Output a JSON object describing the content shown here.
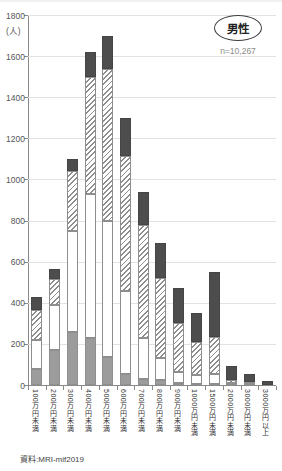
{
  "chart_data": {
    "type": "bar",
    "stacked": true,
    "unit_label": "(人)",
    "ylim": [
      0,
      1800
    ],
    "ytick_step": 200,
    "grid": true,
    "categories": [
      "100万円未満",
      "200万円未満",
      "300万円未満",
      "400万円未満",
      "500万円未満",
      "600万円未満",
      "700万円未満",
      "800万円未満",
      "900万円未満",
      "1000万円未満",
      "1500万円未満",
      "2000万円未満",
      "3000万円未満",
      "3000万円以上"
    ],
    "series": [
      {
        "name": "bottom-gray-solid",
        "pattern": "gray",
        "color": "#9c9c9c",
        "values": [
          80,
          170,
          260,
          230,
          135,
          55,
          30,
          25,
          10,
          5,
          5,
          0,
          0,
          0
        ]
      },
      {
        "name": "white-plain",
        "pattern": "white",
        "color": "#ffffff",
        "values": [
          140,
          220,
          490,
          700,
          665,
          400,
          200,
          105,
          55,
          45,
          50,
          10,
          5,
          0
        ]
      },
      {
        "name": "diagonal-hatch",
        "pattern": "hatch",
        "color": "#8e8e8e",
        "values": [
          145,
          125,
          290,
          570,
          735,
          660,
          550,
          390,
          235,
          160,
          180,
          15,
          10,
          0
        ]
      },
      {
        "name": "top-dark-gray",
        "pattern": "dark",
        "color": "#4d4d4d",
        "values": [
          65,
          50,
          60,
          120,
          165,
          185,
          160,
          170,
          170,
          140,
          315,
          70,
          40,
          20
        ]
      }
    ],
    "totals": [
      430,
      565,
      1100,
      1620,
      1700,
      1300,
      940,
      690,
      470,
      350,
      550,
      95,
      55,
      20
    ],
    "legend": {
      "label": "男性",
      "n_label": "n=10,267"
    },
    "source": "資料:MRI-mif2019"
  }
}
